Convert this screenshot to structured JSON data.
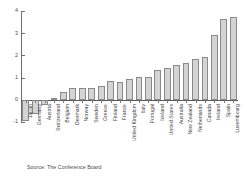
{
  "chart_data": {
    "type": "bar",
    "title": "",
    "subtitle": "",
    "xlabel": "",
    "ylabel": "",
    "ylim": [
      -1,
      4
    ],
    "yticks": [
      -1,
      0,
      1,
      2,
      3,
      4
    ],
    "ytick_labels": [
      "-1",
      "0",
      "1",
      "2",
      "3",
      "4"
    ],
    "grid": false,
    "legend": "none",
    "orientation": "vertical",
    "bar_color": "#d4d4d4",
    "bar_edge_color": "#8a8a8a",
    "axis_color": "#6e6e6e",
    "categories": [
      "Japan",
      "Germany",
      "Austria",
      "Switzerland",
      "Belgium",
      "Denmark",
      "Norway",
      "Sweden",
      "Greece",
      "Finland",
      "France",
      "United Kingdom",
      "Italy",
      "Portugal",
      "Iceland",
      "United States",
      "Australia",
      "New Zealand",
      "Netherlands",
      "Canada",
      "Ireland",
      "Spain",
      "Luxembourg"
    ],
    "values": [
      -0.95,
      -0.63,
      -0.22,
      0.08,
      0.33,
      0.53,
      0.53,
      0.53,
      0.64,
      0.84,
      0.82,
      0.92,
      1.02,
      1.03,
      1.34,
      1.42,
      1.56,
      1.64,
      1.83,
      1.92,
      2.92,
      3.62,
      3.72
    ]
  },
  "footer": {
    "source": "Source: The Conference Board"
  }
}
